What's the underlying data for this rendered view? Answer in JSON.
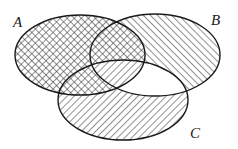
{
  "diagram": {
    "type": "venn",
    "sets": [
      {
        "id": "A",
        "label": "A",
        "cx": 80,
        "cy": 55,
        "rx": 65,
        "ry": 40,
        "fill": "crosshatch"
      },
      {
        "id": "B",
        "label": "B",
        "cx": 155,
        "cy": 55,
        "rx": 65,
        "ry": 41,
        "fill": "hatch-backslash"
      },
      {
        "id": "C",
        "label": "C",
        "cx": 123,
        "cy": 100,
        "rx": 65,
        "ry": 40,
        "fill": "hatch-slash"
      }
    ],
    "regions": {
      "A_only": "crosshatch",
      "A_and_B_only": "crosshatch",
      "A_and_C_only": "crosshatch",
      "A_and_B_and_C": "hatch-slash",
      "B_only": "hatch-backslash",
      "C_only": "hatch-slash",
      "B_and_C_only": "none"
    },
    "colors": {
      "stroke": "#1a1a1a",
      "hatch": "#333333",
      "background": "#ffffff"
    }
  },
  "labels": {
    "A": "A",
    "B": "B",
    "C": "C"
  }
}
